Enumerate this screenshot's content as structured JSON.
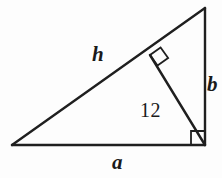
{
  "figure": {
    "background_color": "#fdfdfd",
    "stroke_color": "#1f1f1f",
    "text_color": "#1a1a1a",
    "stroke_width": 2.4,
    "marker_stroke_width": 1.8,
    "labels": {
      "hypotenuse": "h",
      "vertical_leg": "b",
      "horizontal_leg": "a",
      "altitude": "12"
    },
    "vertices": {
      "left": {
        "x": 12,
        "y": 145
      },
      "top_right": {
        "x": 205,
        "y": 8
      },
      "bottom_right": {
        "x": 205,
        "y": 145
      },
      "altitude_foot": {
        "x": 150,
        "y": 55
      }
    },
    "right_angle_markers": [
      {
        "name": "altitude-foot-right-angle",
        "x": 150,
        "y": 55,
        "size": 13,
        "rotation_deg": -35.4
      },
      {
        "name": "bottom-right-right-angle",
        "x": 205,
        "y": 145,
        "size": 14,
        "rotation_deg": 0
      }
    ]
  }
}
